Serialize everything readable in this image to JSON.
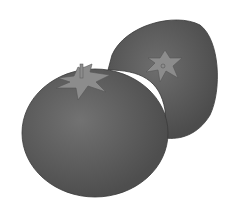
{
  "image": {
    "subject": "two tomatoes illustration",
    "colors": {
      "background": "#ffffff",
      "tomato_body": "#5f5f5f",
      "tomato_dark": "#4a4a4a",
      "tomato_light": "#7a7a7a",
      "calyx": "#8c8c8c",
      "outline": "#3a3a3a"
    }
  }
}
